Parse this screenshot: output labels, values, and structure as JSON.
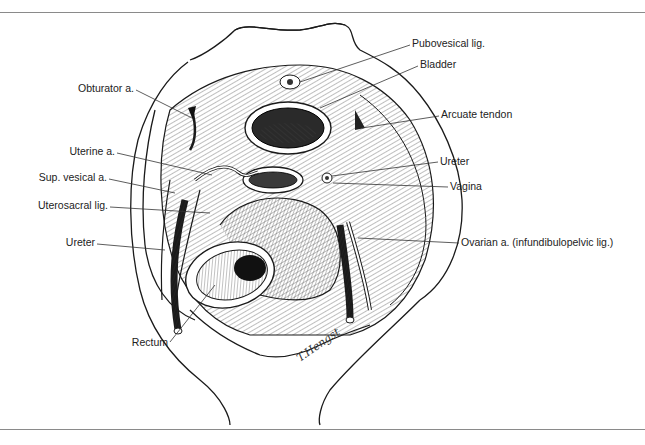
{
  "figure": {
    "signature": "T.Hengst",
    "labels": {
      "pubovesical_lig": "Pubovesical lig.",
      "bladder": "Bladder",
      "arcuate_tendon": "Arcuate tendon",
      "ureter_right": "Ureter",
      "vagina": "Vagina",
      "ovarian_a": "Ovarian a. (infundibulopelvic lig.)",
      "obturator_a": "Obturator a.",
      "uterine_a": "Uterine a.",
      "sup_vesical_a": "Sup. vesical a.",
      "uterosacral_lig": "Uterosacral lig.",
      "ureter_left": "Ureter",
      "rectum": "Rectum"
    }
  },
  "colors": {
    "ink": "#1a1a1a",
    "rule": "#8a8a8a",
    "background": "#ffffff"
  }
}
